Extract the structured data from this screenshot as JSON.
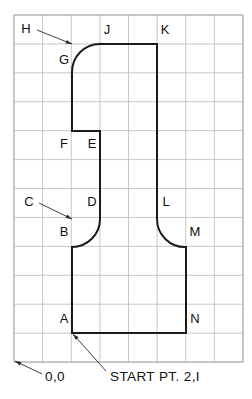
{
  "drawing": {
    "title": "Contour point layout on grid",
    "colors": {
      "background": "#ffffff",
      "grid_minor": "#b9b9b9",
      "grid_frame": "#8f8f8f",
      "profile": "#1a1a1a",
      "leader": "#2a2a2a",
      "text": "#111111"
    },
    "grid": {
      "origin_x": 14,
      "origin_y": 15,
      "cell_width": 28.625,
      "cell_height": 28.92,
      "columns": 8,
      "rows": 12
    },
    "point_labels": [
      {
        "id": "H",
        "text": "H",
        "x": 26,
        "y": 30
      },
      {
        "id": "J",
        "text": "J",
        "x": 107,
        "y": 31
      },
      {
        "id": "K",
        "text": "K",
        "x": 165,
        "y": 31
      },
      {
        "id": "G",
        "text": "G",
        "x": 64,
        "y": 61
      },
      {
        "id": "F",
        "text": "F",
        "x": 64,
        "y": 145
      },
      {
        "id": "E",
        "text": "E",
        "x": 92,
        "y": 145
      },
      {
        "id": "C",
        "text": "C",
        "x": 29,
        "y": 203
      },
      {
        "id": "D",
        "text": "D",
        "x": 92,
        "y": 203
      },
      {
        "id": "L",
        "text": "L",
        "x": 166,
        "y": 203
      },
      {
        "id": "B",
        "text": "B",
        "x": 64,
        "y": 233
      },
      {
        "id": "M",
        "text": "M",
        "x": 195,
        "y": 233
      },
      {
        "id": "A",
        "text": "A",
        "x": 64,
        "y": 320
      },
      {
        "id": "N",
        "text": "N",
        "x": 195,
        "y": 320
      }
    ],
    "notes": [
      {
        "id": "origin-note",
        "text": "0,0",
        "x": 45,
        "y": 377
      },
      {
        "id": "start-point-note",
        "text": "START PT. 2,I",
        "x": 110,
        "y": 377
      }
    ],
    "leaders": [
      {
        "id": "leader-h",
        "x1": 37,
        "y1": 30,
        "x2": 72,
        "y2": 44
      },
      {
        "id": "leader-c",
        "x1": 39,
        "y1": 203,
        "x2": 72,
        "y2": 219
      },
      {
        "id": "leader-origin",
        "x1": 42,
        "y1": 374,
        "x2": 15,
        "y2": 361
      },
      {
        "id": "leader-start",
        "x1": 106,
        "y1": 371,
        "x2": 73,
        "y2": 334
      }
    ],
    "profile": {
      "start_point": "A",
      "description": "Closed contour A-B-arc-D-E-F-G-arc-J-K-M-N-A",
      "vertices": [
        {
          "id": "A",
          "x": 72,
          "y": 333
        },
        {
          "id": "B",
          "x": 72,
          "y": 247
        },
        {
          "id": "D",
          "x": 100,
          "y": 219
        },
        {
          "id": "E",
          "x": 100,
          "y": 131
        },
        {
          "id": "F",
          "x": 72,
          "y": 131
        },
        {
          "id": "G",
          "x": 72,
          "y": 73
        },
        {
          "id": "J",
          "x": 100,
          "y": 44
        },
        {
          "id": "K",
          "x": 157,
          "y": 44
        },
        {
          "id": "L",
          "x": 157,
          "y": 219
        },
        {
          "id": "M",
          "x": 186,
          "y": 247
        },
        {
          "id": "N",
          "x": 186,
          "y": 333
        }
      ],
      "path": "M 72 333 L 72 247 A 28 28 0 0 0 100 219 L 100 131 L 72 131 L 72 73 A 28 28 0 0 1 100 44 L 157 44 L 157 219 A 28 28 0 0 0 186 247 L 186 333 Z"
    }
  }
}
